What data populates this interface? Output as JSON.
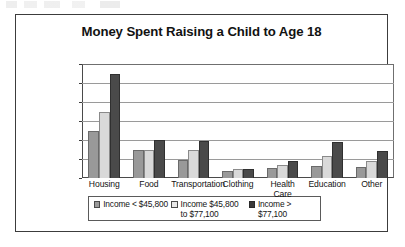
{
  "chart_data": {
    "type": "bar",
    "title": "Money Spent Raising a Child to Age 18",
    "xlabel": "",
    "ylabel": "",
    "ylim": [
      0,
      120000
    ],
    "grid": true,
    "legend_position": "bottom",
    "categories": [
      "Housing",
      "Food",
      "Transportation",
      "Clothing",
      "Health\nCare",
      "Education",
      "Other"
    ],
    "ytick_labels": [
      "$120,000",
      "$100,000",
      "$80,000",
      "$60,000",
      "$40,000",
      "$20,000",
      "$0"
    ],
    "ytick_values": [
      120000,
      100000,
      80000,
      60000,
      40000,
      20000,
      0
    ],
    "series": [
      {
        "name": "Income < $45,800",
        "color": "#999999",
        "values": [
          50000,
          30000,
          19000,
          7000,
          11000,
          13000,
          12000
        ]
      },
      {
        "name": "Income $45,800\nto $77,100",
        "color": "#d9d9d9",
        "values": [
          70000,
          30000,
          29000,
          9000,
          14000,
          23000,
          18000
        ]
      },
      {
        "name": "Income > $77,100",
        "color": "#4a4a4a",
        "values": [
          110000,
          40000,
          39000,
          9000,
          18000,
          38000,
          28000
        ]
      }
    ]
  },
  "legend": {
    "items": [
      {
        "label": "Income < $45,800"
      },
      {
        "label": "Income $45,800\nto $77,100"
      },
      {
        "label": "Income > $77,100"
      }
    ]
  }
}
